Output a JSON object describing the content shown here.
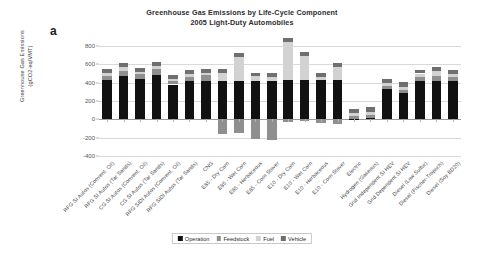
{
  "panel_letter": "a",
  "title": {
    "line1": "Greenhouse Gas Emissions by Life-Cycle Component",
    "line2": "2005 Light-Duty Automobiles"
  },
  "legend": {
    "items": [
      {
        "label": "Operation",
        "color": "#111111",
        "key": "operation"
      },
      {
        "label": "Feedstock",
        "color": "#8f8f8f",
        "key": "feedstock"
      },
      {
        "label": "Fuel",
        "color": "#d2d2d2",
        "key": "fuel"
      },
      {
        "label": "Vehicle",
        "color": "#6f6f6f",
        "key": "vehicle"
      }
    ]
  },
  "chart_data": {
    "type": "bar",
    "subtype": "stacked",
    "title": "Greenhouse Gas Emissions by Life-Cycle Component\n2005 Light-Duty Automobiles",
    "xlabel": "",
    "ylabel": "Greenhouse Gas Emissions (gCO2-eq/VMT)",
    "ylabel_line1": "Greenhouse Gas Emissions",
    "ylabel_line2": "(gCO2-eq/VMT)",
    "ylim": [
      -400,
      800
    ],
    "yticks": [
      800,
      600,
      400,
      200,
      0,
      -200,
      -400
    ],
    "grid": true,
    "legend_position": "bottom",
    "categories": [
      "RFG SI Autos (Convent. Oil)",
      "RFG SI Autos (Tar Sands)",
      "CG SI Autos (Convent. Oil)",
      "CG SI Autos (Tar Sands)",
      "RFG SIDI Autos (Convent. Oil)",
      "RFG SIDI Autos (Tar Sands)",
      "CNG",
      "E85 - Dry Corn",
      "E85 - Wet Corn",
      "E85 - Herbaceous",
      "E85 - Corn Stover",
      "E10 - Dry Corn",
      "E10 - Wet Corn",
      "E10 - Herbaceous",
      "E10 - Corn Stover",
      "Electric",
      "Hydrogen (Gaseous)",
      "Grid Independent SI HEV",
      "Grid Dependent SI HEV",
      "Diesel (Low Sulfur)",
      "Diesel (Fischer-Tropsch)",
      "Diesel (Soy BD20)"
    ],
    "series": [
      {
        "name": "Operation",
        "color": "#111111",
        "values": [
          430,
          470,
          445,
          485,
          380,
          420,
          420,
          415,
          415,
          415,
          415,
          425,
          425,
          425,
          425,
          5,
          10,
          330,
          290,
          420,
          420,
          420
        ]
      },
      {
        "name": "Feedstock",
        "color": "#8f8f8f",
        "values": [
          45,
          60,
          45,
          60,
          40,
          45,
          60,
          -160,
          -145,
          -215,
          -230,
          -25,
          -20,
          -45,
          -50,
          30,
          35,
          35,
          35,
          45,
          55,
          40
        ]
      },
      {
        "name": "Fuel",
        "color": "#d2d2d2",
        "values": [
          30,
          40,
          30,
          40,
          25,
          30,
          30,
          90,
          265,
          55,
          50,
          420,
          270,
          40,
          150,
          30,
          40,
          30,
          30,
          35,
          55,
          35
        ]
      },
      {
        "name": "Vehicle",
        "color": "#6f6f6f",
        "values": [
          40,
          45,
          40,
          45,
          40,
          40,
          40,
          40,
          40,
          40,
          40,
          40,
          40,
          40,
          40,
          45,
          45,
          50,
          50,
          40,
          45,
          40
        ]
      }
    ]
  }
}
